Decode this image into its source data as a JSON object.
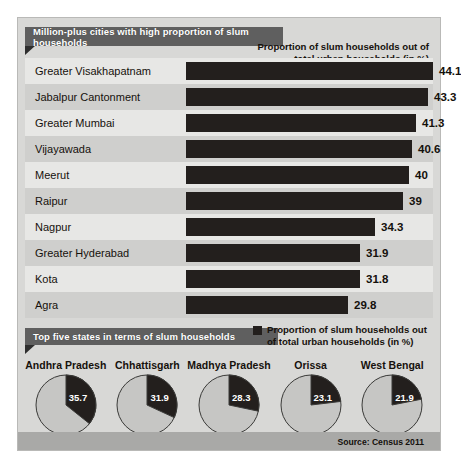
{
  "banners": {
    "cities": "Million-plus cities with high proportion of slum households",
    "states": "Top five states in terms of slum households"
  },
  "column_header": "Proportion of slum households out of total urban households (in %)",
  "legend": {
    "swatch_color": "#231f1d",
    "text": "Proportion of slum households out of total urban households (in %)"
  },
  "source": "Source: Census 2011",
  "colors": {
    "panel_background": "#d8d8d6",
    "ribbon": "#5f5f5f",
    "bar": "#231f1d",
    "row_light": "#e7e7e5",
    "row_dark": "#cfcfcd",
    "pie_remainder": "#c6c6c4",
    "text": "#16110c"
  },
  "chart_data": [
    {
      "type": "bar",
      "title": "Million-plus cities with high proportion of slum households",
      "xlabel": "Proportion of slum households out of total urban households (in %)",
      "ylabel": "",
      "orientation": "horizontal",
      "grid": false,
      "xlim": [
        0,
        45
      ],
      "categories": [
        "Greater Visakhapatnam",
        "Jabalpur Cantonment",
        "Greater Mumbai",
        "Vijayawada",
        "Meerut",
        "Raipur",
        "Nagpur",
        "Greater Hyderabad",
        "Kota",
        "Agra"
      ],
      "values": [
        44.1,
        43.3,
        41.3,
        40.6,
        40,
        39,
        34.3,
        31.9,
        31.8,
        29.8
      ],
      "value_labels": [
        "44.1",
        "43.3",
        "41.3",
        "40.6",
        "40",
        "39",
        "34.3",
        "31.9",
        "31.8",
        "29.8"
      ]
    },
    {
      "type": "pie",
      "title": "Top five states in terms of slum households",
      "legend": "Proportion of slum households out of total urban households (in %)",
      "categories": [
        "Andhra Pradesh",
        "Chhattisgarh",
        "Madhya Pradesh",
        "Orissa",
        "West Bengal"
      ],
      "values": [
        35.7,
        31.9,
        28.3,
        23.1,
        21.9
      ],
      "value_labels": [
        "35.7",
        "31.9",
        "28.3",
        "23.1",
        "21.9"
      ]
    }
  ]
}
